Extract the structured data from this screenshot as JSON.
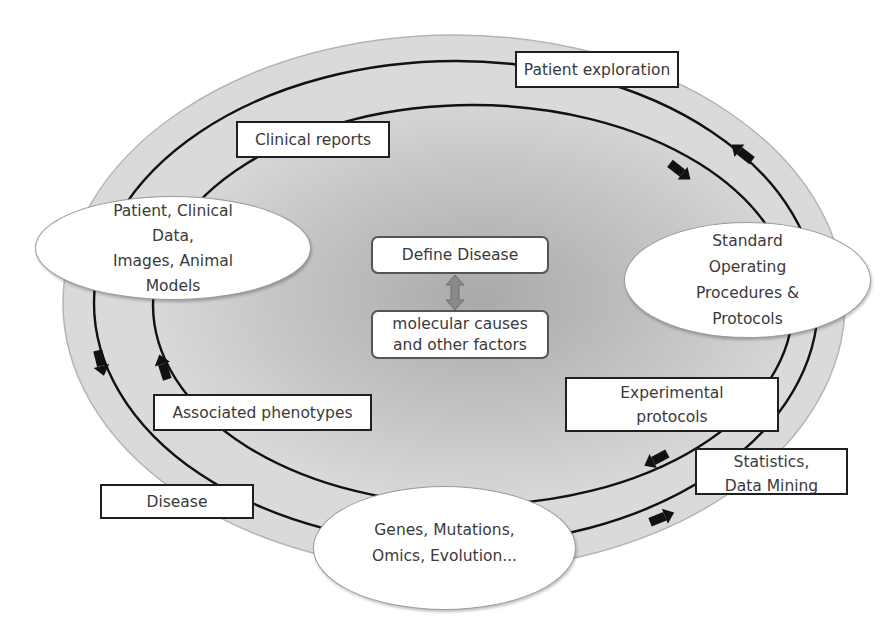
{
  "diagram": {
    "type": "cyclic-workflow",
    "colors": {
      "outer_fill": "#d6d6d6",
      "center_fill": "#a8a8a8",
      "line": "#111111",
      "box_border": "#1f1f1f",
      "double_arrow": "#8a8a8a"
    },
    "labels": {
      "patient_exploration": "Patient exploration",
      "clinical_reports": "Clinical reports",
      "patient_clinical": [
        "Patient, Clinical",
        "Data,",
        "Images, Animal",
        "Models"
      ],
      "define_disease": "Define Disease",
      "molecular_causes": [
        "molecular causes",
        "and other factors"
      ],
      "sop": [
        "Standard",
        "Operating",
        "Procedures &",
        "Protocols"
      ],
      "associated_phenotypes": "Associated phenotypes",
      "experimental_protocols": [
        "Experimental",
        "protocols"
      ],
      "statistics": [
        "Statistics,",
        "Data Mining"
      ],
      "disease": "Disease",
      "genes": [
        "Genes, Mutations,",
        "Omics, Evolution..."
      ]
    },
    "arrows": [
      {
        "ring": "inner",
        "position": "top-right",
        "direction": "clockwise"
      },
      {
        "ring": "outer",
        "position": "top-right",
        "direction": "counter-clockwise"
      },
      {
        "ring": "inner",
        "position": "bottom-right",
        "direction": "clockwise"
      },
      {
        "ring": "outer",
        "position": "bottom-right",
        "direction": "counter-clockwise"
      },
      {
        "ring": "outer",
        "position": "left",
        "direction": "counter-clockwise"
      },
      {
        "ring": "inner",
        "position": "left",
        "direction": "clockwise"
      }
    ],
    "center_link": "bidirectional"
  }
}
